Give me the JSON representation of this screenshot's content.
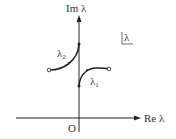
{
  "diagram": {
    "title": "",
    "axes": {
      "y_label": "Im λ",
      "x_label": "Re λ",
      "origin_label": "O"
    },
    "plane_label": "λ",
    "curves": [
      {
        "name": "λ",
        "subscript": "2",
        "start": "open-circle-left",
        "end": "imaginary-axis-upper"
      },
      {
        "name": "λ",
        "subscript": "1",
        "start": "imaginary-axis-lower",
        "end": "open-circle-right"
      }
    ],
    "colors": {
      "line": "#222222",
      "background": "#ffffff"
    }
  }
}
